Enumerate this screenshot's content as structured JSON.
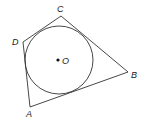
{
  "figure": {
    "type": "quadrilateral-circumscribing-circle",
    "stroke_color": "#333333",
    "background": "#ffffff"
  },
  "vertices": {
    "A": {
      "label": "A",
      "x": 30,
      "y": 107,
      "label_x": 26,
      "label_y": 117
    },
    "B": {
      "label": "B",
      "x": 128,
      "y": 72,
      "label_x": 131,
      "label_y": 78
    },
    "C": {
      "label": "C",
      "x": 61,
      "y": 16,
      "label_x": 57,
      "label_y": 12
    },
    "D": {
      "label": "D",
      "x": 23,
      "y": 42,
      "label_x": 12,
      "label_y": 45
    }
  },
  "circle": {
    "center_label": "O",
    "cx": 59,
    "cy": 60,
    "r": 34,
    "label_x": 62,
    "label_y": 64
  },
  "labels": {
    "A": "A",
    "B": "B",
    "C": "C",
    "D": "D",
    "O": "O"
  }
}
